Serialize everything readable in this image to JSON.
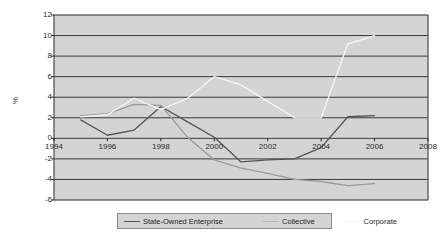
{
  "chart_data": {
    "type": "line",
    "title": "",
    "xlabel": "",
    "ylabel": "%",
    "xlim": [
      1994,
      2008
    ],
    "ylim": [
      -6,
      12
    ],
    "xticks": [
      1994,
      1996,
      1998,
      2000,
      2002,
      2004,
      2006,
      2008
    ],
    "yticks": [
      -6,
      -4,
      -2,
      0,
      2,
      4,
      6,
      8,
      10,
      12
    ],
    "grid": "horizontal",
    "legend_position": "bottom",
    "plot_background": "#d4d4d4",
    "page_background": "#ffffff",
    "series": [
      {
        "name": "State-Owned Enterprise",
        "color": "#555555",
        "x": [
          1995,
          1996,
          1997,
          1998,
          1999,
          2000,
          2001,
          2002,
          2003,
          2004,
          2005,
          2006
        ],
        "values": [
          1.8,
          0.3,
          0.8,
          3.1,
          1.6,
          0.1,
          -2.3,
          -2.1,
          -2.0,
          -0.9,
          2.1,
          2.2
        ]
      },
      {
        "name": "Collective",
        "color": "#9a9a9a",
        "x": [
          1995,
          1996,
          1997,
          1998,
          1999,
          2000,
          2001,
          2002,
          2003,
          2004,
          2005,
          2006
        ],
        "values": [
          2.2,
          2.4,
          3.3,
          3.2,
          0.1,
          -2.1,
          -2.9,
          -3.4,
          -4.0,
          -4.2,
          -4.6,
          -4.4
        ]
      },
      {
        "name": "Corporate",
        "color": "#f6f6f6",
        "x": [
          1995,
          1996,
          1997,
          1998,
          1999,
          2000,
          2001,
          2002,
          2003,
          2004,
          2005,
          2006
        ],
        "values": [
          2.1,
          2.3,
          3.9,
          2.8,
          3.9,
          6.0,
          5.2,
          3.6,
          2.0,
          2.0,
          9.2,
          10.0
        ]
      }
    ],
    "legend": [
      {
        "label": "State-Owned Enterprise",
        "color": "#555555"
      },
      {
        "label": "Collective",
        "color": "#b5b5b5"
      },
      {
        "label": "Corporate",
        "color": "#f2f2f2"
      }
    ],
    "axis_color": "#2b2b2b",
    "gridline_color": "#3a3a3a"
  }
}
